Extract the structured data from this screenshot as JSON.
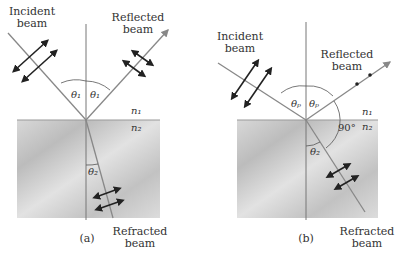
{
  "panel_a": {
    "incident": "Incident\nbeam",
    "reflected": "Reflected\nbeam",
    "refracted": "Refracted\nbeam",
    "theta1": "θ₁",
    "theta2": "θ₂",
    "n1": "n₁",
    "n2": "n₂",
    "caption": "(a)"
  },
  "panel_b": {
    "incident": "Incident\nbeam",
    "reflected": "Reflected\nbeam",
    "refracted": "Refracted\nbeam",
    "thetap": "θₚ",
    "theta2": "θ₂",
    "n1": "n₁",
    "n2": "n₂",
    "angle": "90°",
    "caption": "(b)"
  },
  "colors": {
    "ray": "#8a8a8a",
    "medium": "#cfcfcf",
    "arrow": "#222222"
  }
}
